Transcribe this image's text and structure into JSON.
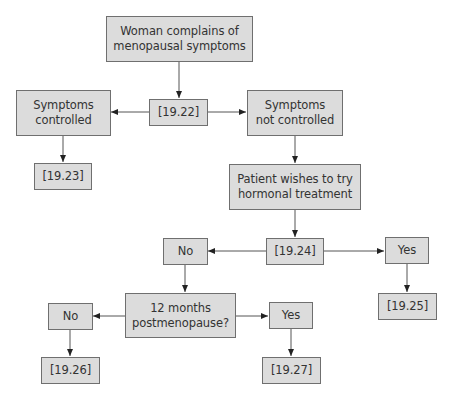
{
  "diagram": {
    "type": "flowchart",
    "nodes": {
      "start": "Woman complains of\nmenopausal symptoms",
      "ref_1922": "[19.22]",
      "controlled": "Symptoms\ncontrolled",
      "not_controlled": "Symptoms\nnot controlled",
      "ref_1923": "[19.23]",
      "wishes_hrt": "Patient wishes to try\nhormonal treatment",
      "ref_1924": "[19.24]",
      "no_1": "No",
      "yes_1": "Yes",
      "ref_1925": "[19.25]",
      "postmeno": "12 months\npostmenopause?",
      "no_2": "No",
      "yes_2": "Yes",
      "ref_1926": "[19.26]",
      "ref_1927": "[19.27]"
    },
    "edges": [
      [
        "start",
        "ref_1922"
      ],
      [
        "ref_1922",
        "controlled"
      ],
      [
        "ref_1922",
        "not_controlled"
      ],
      [
        "controlled",
        "ref_1923"
      ],
      [
        "not_controlled",
        "wishes_hrt"
      ],
      [
        "wishes_hrt",
        "ref_1924"
      ],
      [
        "ref_1924",
        "no_1"
      ],
      [
        "ref_1924",
        "yes_1"
      ],
      [
        "yes_1",
        "ref_1925"
      ],
      [
        "no_1",
        "postmeno"
      ],
      [
        "postmeno",
        "no_2"
      ],
      [
        "postmeno",
        "yes_2"
      ],
      [
        "no_2",
        "ref_1926"
      ],
      [
        "yes_2",
        "ref_1927"
      ]
    ],
    "colors": {
      "node_fill": "#dcdcdc",
      "node_border": "#6f6f6f",
      "edge": "#555555",
      "text": "#333333"
    }
  }
}
